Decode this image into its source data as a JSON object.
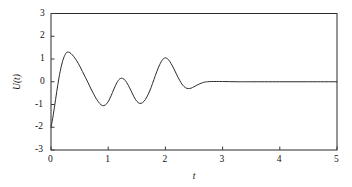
{
  "chart_data": {
    "type": "line",
    "title": "",
    "xlabel": "t",
    "ylabel": "U(t)",
    "xlim": [
      0,
      5
    ],
    "ylim": [
      -3,
      3
    ],
    "xticks": [
      0,
      1,
      2,
      3,
      4,
      5
    ],
    "xtick_labels": [
      "0",
      "1",
      "2",
      "3",
      "4",
      "5"
    ],
    "yticks": [
      -3,
      -2,
      -1,
      0,
      1,
      2,
      3
    ],
    "ytick_labels": [
      "-3",
      "-2",
      "-1",
      "0",
      "1",
      "2",
      "3"
    ],
    "grid": false,
    "legend": null,
    "line_color": "#2b2b2b",
    "line_width": 1.0,
    "background_color": "#ffffff",
    "axes_color": "#2b2b2b",
    "annotations": [],
    "series": [
      {
        "name": "U(t)",
        "x": [
          0.0,
          0.02,
          0.04,
          0.06,
          0.08,
          0.1,
          0.12,
          0.14,
          0.16,
          0.18,
          0.2,
          0.23,
          0.27,
          0.31,
          0.35,
          0.4,
          0.45,
          0.5,
          0.55,
          0.6,
          0.65,
          0.7,
          0.75,
          0.8,
          0.85,
          0.9,
          0.95,
          1.0,
          1.05,
          1.1,
          1.15,
          1.2,
          1.25,
          1.3,
          1.35,
          1.4,
          1.45,
          1.5,
          1.55,
          1.6,
          1.65,
          1.7,
          1.75,
          1.8,
          1.85,
          1.9,
          1.95,
          2.0,
          2.05,
          2.1,
          2.15,
          2.2,
          2.25,
          2.3,
          2.35,
          2.4,
          2.45,
          2.5,
          2.55,
          2.6,
          2.65,
          2.7,
          2.8,
          3.0,
          3.25,
          3.5,
          4.0,
          4.5,
          5.0
        ],
        "y": [
          -2.0,
          -1.75,
          -1.45,
          -1.12,
          -0.78,
          -0.44,
          -0.12,
          0.18,
          0.45,
          0.68,
          0.88,
          1.1,
          1.28,
          1.3,
          1.24,
          1.1,
          0.92,
          0.7,
          0.45,
          0.2,
          -0.05,
          -0.32,
          -0.56,
          -0.78,
          -0.95,
          -1.05,
          -1.02,
          -0.88,
          -0.62,
          -0.32,
          -0.05,
          0.12,
          0.15,
          0.05,
          -0.15,
          -0.4,
          -0.66,
          -0.86,
          -0.95,
          -0.92,
          -0.78,
          -0.55,
          -0.25,
          0.1,
          0.45,
          0.75,
          0.97,
          1.05,
          0.98,
          0.8,
          0.56,
          0.3,
          0.06,
          -0.14,
          -0.26,
          -0.3,
          -0.28,
          -0.22,
          -0.15,
          -0.09,
          -0.04,
          -0.01,
          0.01,
          0.01,
          0.0,
          0.0,
          0.0,
          0.0,
          0.0
        ]
      }
    ]
  },
  "figure": {
    "ylabel_display": "U(t)",
    "xlabel_display": "t"
  }
}
